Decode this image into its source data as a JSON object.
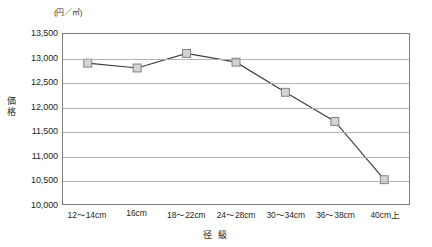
{
  "chart_data": {
    "type": "line",
    "title": "",
    "unit_label": "(円／㎥)",
    "xlabel": "径 級",
    "ylabel": "価格",
    "categories": [
      "12〜14cm",
      "16cm",
      "18〜22cm",
      "24〜28cm",
      "30〜34cm",
      "36〜38cm",
      "40cm上"
    ],
    "values": [
      12900,
      12800,
      13100,
      12920,
      12300,
      11700,
      10500
    ],
    "ylim": [
      10000,
      13500
    ],
    "yticks": [
      13500,
      13000,
      12500,
      12000,
      11500,
      11000,
      10500,
      10000
    ],
    "ytick_labels": [
      "13,500",
      "13,000",
      "12,500",
      "12,000",
      "11,500",
      "11,000",
      "10,500",
      "10,000"
    ],
    "grid": true,
    "legend": "none",
    "series": [
      {
        "name": "価格",
        "values": [
          12900,
          12800,
          13100,
          12920,
          12300,
          11700,
          10500
        ],
        "line_color": "#3f3f3f",
        "marker_fill": "#d4d4d4",
        "marker_stroke": "#808080",
        "marker": "square"
      }
    ]
  },
  "colors": {
    "plot_border": "#7f7f7f",
    "gridline": "#b3b3b3",
    "text": "#231f20",
    "background": "#ffffff"
  }
}
